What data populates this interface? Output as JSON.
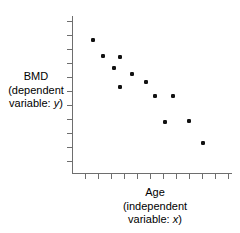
{
  "figure": {
    "kind": "scatter-plot",
    "background": "#ffffff",
    "axis_color": "#6e6e6e",
    "point_color": "#111111"
  },
  "y_axis_label": {
    "line1": "BMD",
    "line2": "(dependent",
    "line3_prefix": "variable: ",
    "line3_var": "y",
    "line3_suffix": ")"
  },
  "x_axis_label": {
    "line1": "Age",
    "line2": "(independent",
    "line3_prefix": "variable: ",
    "line3_var": "x",
    "line3_suffix": ")"
  },
  "chart_data": {
    "type": "scatter",
    "title": "",
    "xlabel": "Age (independent variable: x)",
    "ylabel": "BMD (dependent variable: y)",
    "grid": false,
    "legend": false,
    "xlim": [
      0,
      1
    ],
    "ylim": [
      0,
      1
    ],
    "x_tick_count": 12,
    "y_tick_count": 11,
    "x_tick_labels": [],
    "y_tick_labels": [],
    "note": "Normalized plot-area coordinates; axes are unlabeled. x increases with Age, y increases with BMD. Trend is negative (BMD declines with Age).",
    "points_normalized": [
      {
        "x": 0.131,
        "y": 0.848
      },
      {
        "x": 0.194,
        "y": 0.746
      },
      {
        "x": 0.3,
        "y": 0.74
      },
      {
        "x": 0.263,
        "y": 0.67
      },
      {
        "x": 0.375,
        "y": 0.632
      },
      {
        "x": 0.3,
        "y": 0.551
      },
      {
        "x": 0.463,
        "y": 0.58
      },
      {
        "x": 0.519,
        "y": 0.49
      },
      {
        "x": 0.631,
        "y": 0.49
      },
      {
        "x": 0.581,
        "y": 0.325
      },
      {
        "x": 0.731,
        "y": 0.331
      },
      {
        "x": 0.819,
        "y": 0.191
      }
    ],
    "points_pixel": [
      {
        "x": 93,
        "y": 40
      },
      {
        "x": 103,
        "y": 56
      },
      {
        "x": 120,
        "y": 57
      },
      {
        "x": 114,
        "y": 68
      },
      {
        "x": 132,
        "y": 74
      },
      {
        "x": 120,
        "y": 87
      },
      {
        "x": 146,
        "y": 82
      },
      {
        "x": 155,
        "y": 96
      },
      {
        "x": 173,
        "y": 96
      },
      {
        "x": 165,
        "y": 122
      },
      {
        "x": 189,
        "y": 121
      },
      {
        "x": 203,
        "y": 143
      }
    ]
  }
}
